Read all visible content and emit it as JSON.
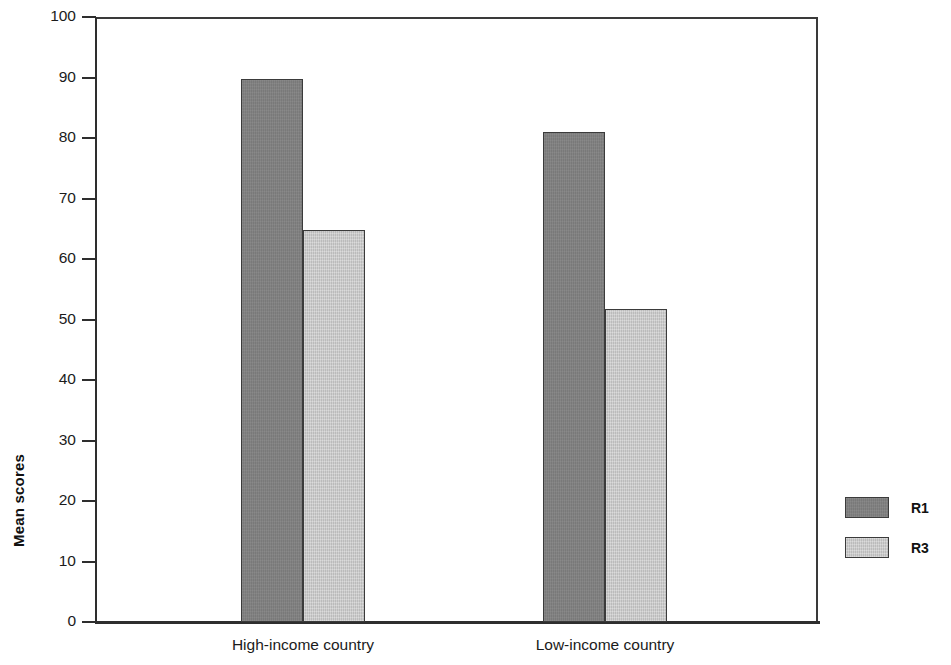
{
  "chart_data": {
    "type": "bar",
    "title": "",
    "xlabel": "",
    "ylabel": "Mean scores",
    "categories": [
      "High-income country",
      "Low-income country"
    ],
    "series": [
      {
        "name": "R1",
        "values": [
          89.7,
          81
        ],
        "color": "#808080"
      },
      {
        "name": "R3",
        "values": [
          64.8,
          51.8
        ],
        "color": "#c8c8c8"
      }
    ],
    "ylim": [
      0,
      100
    ],
    "yticks": [
      0,
      10,
      20,
      30,
      40,
      50,
      60,
      70,
      80,
      90,
      100
    ],
    "ytick_labels": [
      "0",
      "10",
      "20",
      "30",
      "40",
      "50",
      "60",
      "70",
      "80",
      "90",
      "100"
    ],
    "grid": false,
    "legend_position": "right",
    "legend_entries": [
      "R1",
      "R3"
    ],
    "frame": "box",
    "axis_color": "#2e2e2e"
  }
}
